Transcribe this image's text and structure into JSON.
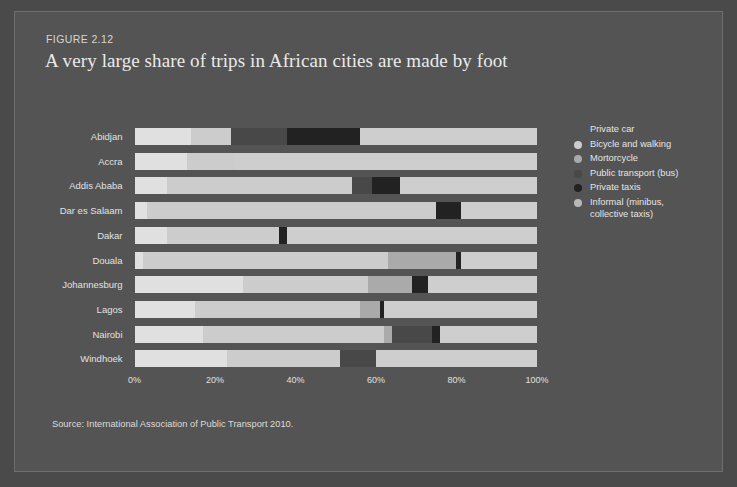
{
  "figure": {
    "number": "FIGURE 2.12",
    "title": "A very large share of trips in African cities are made by foot",
    "source": "Source: International Association of Public Transport 2010."
  },
  "colors": {
    "background": "#4a4a4a",
    "panel": "#545454",
    "private_car": "#d7d7d7",
    "bicycle_and_walking": "#c9c9c9",
    "motorcycle": "#b5b5b5",
    "public_transport_bus": "#474747",
    "private_taxis": "#2b2b2b",
    "informal": "#cecece",
    "text": "#e4e4e4",
    "title_text": "#eaeaea"
  },
  "legend": {
    "position": "right",
    "items": [
      {
        "label": "Private car",
        "color": "#e8e8e8",
        "dot": false
      },
      {
        "label": "Bicycle and walking",
        "color": "#cccccc",
        "dot": true
      },
      {
        "label": "Mortorcycle",
        "color": "#aaaaaa",
        "dot": true
      },
      {
        "label": "Public transport (bus)",
        "color": "#484848",
        "dot": true
      },
      {
        "label": "Private taxis",
        "color": "#222222",
        "dot": true
      },
      {
        "label": "Informal (minibus,\ncollective taxis)",
        "color": "#b8b8b8",
        "dot": true
      }
    ]
  },
  "chart_data": {
    "type": "bar",
    "orientation": "horizontal",
    "stacked": true,
    "title": "A very large share of trips in African cities are made by foot",
    "xlabel": "",
    "ylabel": "",
    "xlim": [
      0,
      100
    ],
    "xticks": [
      "0%",
      "20%",
      "40%",
      "60%",
      "80%",
      "100%"
    ],
    "xtick_values": [
      0,
      20,
      40,
      60,
      80,
      100
    ],
    "grid": false,
    "categories": [
      "Abidjan",
      "Accra",
      "Addis Ababa",
      "Dar es Salaam",
      "Dakar",
      "Douala",
      "Johannesburg",
      "Lagos",
      "Nairobi",
      "Windhoek"
    ],
    "series": [
      {
        "name": "Private car",
        "color": "#e0e0e0",
        "values": [
          14,
          13,
          8,
          3,
          8,
          2,
          27,
          15,
          17,
          23
        ]
      },
      {
        "name": "Bicycle and walking",
        "color": "#cccccc",
        "values": [
          10,
          12,
          46,
          72,
          28,
          61,
          31,
          41,
          45,
          28
        ]
      },
      {
        "name": "Mortorcycle",
        "color": "#aaaaaa",
        "values": [
          0,
          0,
          0,
          0,
          0,
          17,
          11,
          5,
          2,
          0
        ]
      },
      {
        "name": "Public transport (bus)",
        "color": "#484848",
        "values": [
          14,
          0,
          5,
          0,
          0,
          0,
          0,
          0,
          10,
          9
        ]
      },
      {
        "name": "Private taxis",
        "color": "#222222",
        "values": [
          18,
          0,
          7,
          6,
          2,
          1,
          4,
          1,
          2,
          0
        ]
      },
      {
        "name": "Informal (minibus, collective taxis)",
        "color": "#cecece",
        "values": [
          44,
          75,
          34,
          19,
          62,
          19,
          27,
          38,
          24,
          40
        ]
      }
    ]
  }
}
